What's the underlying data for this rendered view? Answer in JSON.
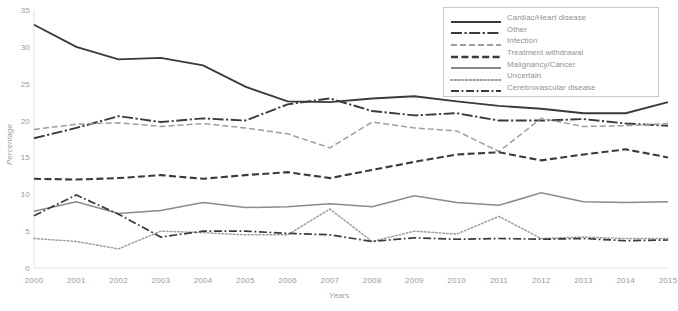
{
  "chart_data": {
    "type": "line",
    "title": "",
    "xlabel": "Years",
    "ylabel": "Percentage",
    "categories": [
      "2000",
      "2001",
      "2002",
      "2003",
      "2004",
      "2005",
      "2006",
      "2007",
      "2008",
      "2009",
      "2010",
      "2011",
      "2012",
      "2013",
      "2014",
      "2015"
    ],
    "x": [
      2000,
      2001,
      2002,
      2003,
      2004,
      2005,
      2006,
      2007,
      2008,
      2009,
      2010,
      2011,
      2012,
      2013,
      2014,
      2015
    ],
    "ylim": [
      0,
      35
    ],
    "xlim": [
      2000,
      2015
    ],
    "ytick_step": 5,
    "yticks": [
      0,
      5,
      10,
      15,
      20,
      25,
      30,
      35
    ],
    "grid": false,
    "legend_position": "top-right",
    "series": [
      {
        "name": "Cardiac/Heart disease",
        "style": "solid",
        "color": "#3a3a3a",
        "values": [
          33.0,
          30.0,
          28.3,
          28.5,
          27.5,
          24.6,
          22.6,
          22.5,
          23.0,
          23.3,
          22.6,
          22.0,
          21.6,
          21.0,
          21.0,
          22.5
        ]
      },
      {
        "name": "Other",
        "style": "long-dash-dot",
        "color": "#3a3a3a",
        "values": [
          17.6,
          19.0,
          20.6,
          19.8,
          20.3,
          20.0,
          22.2,
          23.0,
          21.3,
          20.7,
          21.0,
          20.0,
          20.0,
          20.2,
          19.6,
          19.3
        ]
      },
      {
        "name": "Infection",
        "style": "dashed",
        "color": "#9e9e9e",
        "values": [
          18.8,
          19.5,
          19.7,
          19.2,
          19.6,
          19.0,
          18.2,
          16.3,
          19.8,
          19.0,
          18.6,
          15.8,
          20.3,
          19.2,
          19.3,
          19.6
        ]
      },
      {
        "name": "Treatment withdrawal",
        "style": "dashed-bold",
        "color": "#3a3a3a",
        "values": [
          12.1,
          12.0,
          12.2,
          12.6,
          12.1,
          12.6,
          13.0,
          12.2,
          13.3,
          14.4,
          15.4,
          15.7,
          14.6,
          15.4,
          16.1,
          15.0
        ]
      },
      {
        "name": "Malignancy/Cancer",
        "style": "solid-grey",
        "color": "#8a8a8a",
        "values": [
          7.7,
          9.0,
          7.4,
          7.8,
          8.9,
          8.2,
          8.3,
          8.7,
          8.3,
          9.8,
          8.9,
          8.5,
          10.2,
          9.0,
          8.9,
          9.0
        ]
      },
      {
        "name": "Uncertain",
        "style": "dotted",
        "color": "#9e9e9e",
        "values": [
          4.0,
          3.6,
          2.6,
          5.0,
          4.8,
          4.5,
          4.5,
          8.0,
          3.6,
          5.0,
          4.6,
          7.0,
          4.0,
          4.2,
          4.0,
          4.0
        ]
      },
      {
        "name": "Cerebrovascular disease",
        "style": "dash-dot",
        "color": "#3a3a3a",
        "values": [
          7.1,
          9.9,
          7.3,
          4.2,
          5.0,
          5.0,
          4.7,
          4.5,
          3.6,
          4.1,
          3.9,
          4.0,
          3.9,
          4.0,
          3.7,
          3.8
        ]
      }
    ]
  },
  "legend": {
    "items": [
      {
        "label": "Cardiac/Heart disease",
        "key": "solid"
      },
      {
        "label": "Other",
        "key": "long-dash-dot"
      },
      {
        "label": "Infection",
        "key": "dashed"
      },
      {
        "label": "Treatment withdrawal",
        "key": "dashed-bold"
      },
      {
        "label": "Malignancy/Cancer",
        "key": "solid-grey"
      },
      {
        "label": "Uncertain",
        "key": "dotted"
      },
      {
        "label": "Cerebrovascular disease",
        "key": "dash-dot"
      }
    ]
  }
}
